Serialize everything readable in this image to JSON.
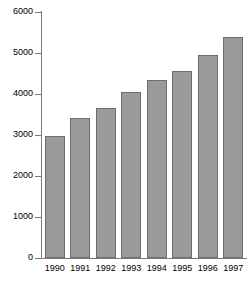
{
  "chart_data": {
    "type": "bar",
    "title": "",
    "subtitle": "",
    "xlabel": "",
    "ylabel": "",
    "categories": [
      "1990",
      "1991",
      "1992",
      "1993",
      "1994",
      "1995",
      "1996",
      "1997"
    ],
    "values": [
      2980,
      3420,
      3670,
      4050,
      4340,
      4560,
      4950,
      5380
    ],
    "ylim": [
      0,
      6000
    ],
    "ytick_values": [
      0,
      1000,
      2000,
      3000,
      4000,
      5000,
      6000
    ],
    "ytick_labels": [
      "0",
      "1000",
      "2000",
      "3000",
      "4000",
      "5000",
      "6000"
    ],
    "grid": false,
    "legend": false,
    "legend_position": "none",
    "series": [
      {
        "name": "",
        "values": [
          2980,
          3420,
          3670,
          4050,
          4340,
          4560,
          4950,
          5380
        ]
      }
    ]
  },
  "style": {
    "bar_fill": "#9a9a9a",
    "bar_stroke": "#6e6e6e",
    "axis_color": "#7a7a7a",
    "text_color": "#000000",
    "background": "#ffffff"
  }
}
